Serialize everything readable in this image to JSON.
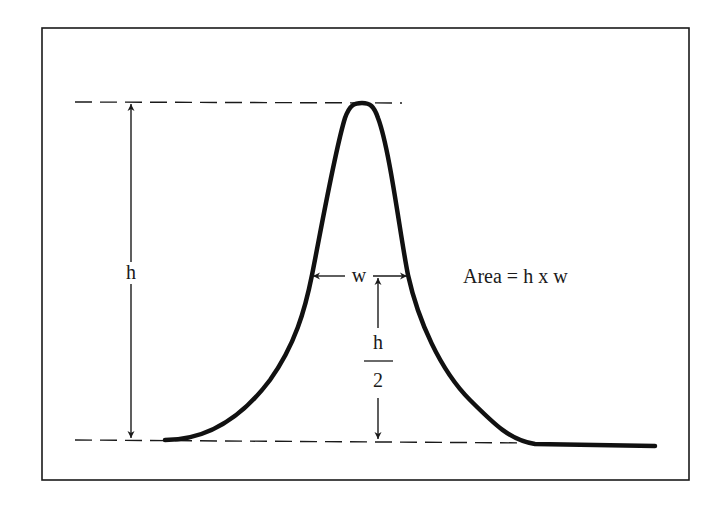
{
  "diagram": {
    "type": "peak-area-estimation",
    "labels": {
      "height": "h",
      "width": "w",
      "half_height_numerator": "h",
      "half_height_denominator": "2",
      "formula": "Area = h x w"
    },
    "colors": {
      "ink": "#1a1a1a",
      "background": "#ffffff"
    }
  }
}
